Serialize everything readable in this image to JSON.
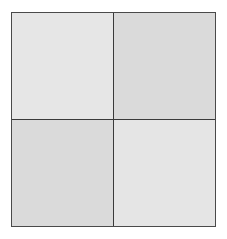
{
  "diagram": {
    "type": "2x2-grid",
    "rows": 2,
    "columns": 2,
    "border_color": "#4a4a4a",
    "cells": [
      {
        "position": "top-left",
        "label": "",
        "color": "#e6e6e6"
      },
      {
        "position": "top-right",
        "label": "",
        "color": "#dadada"
      },
      {
        "position": "bottom-left",
        "label": "",
        "color": "#dadada"
      },
      {
        "position": "bottom-right",
        "label": "",
        "color": "#e5e5e5"
      }
    ]
  }
}
